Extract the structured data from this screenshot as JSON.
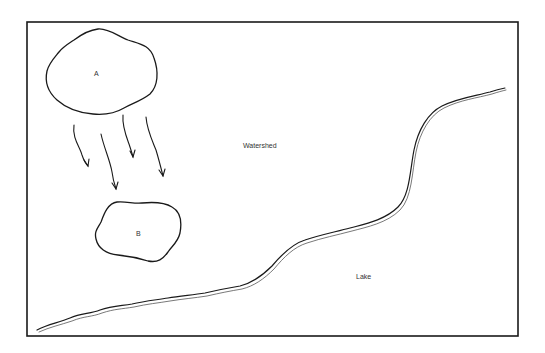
{
  "diagram": {
    "type": "watershed-schematic",
    "frame": {
      "x": 27,
      "y": 22,
      "width": 491,
      "height": 314
    },
    "stroke_color": "#1a1a1a",
    "labels": {
      "area_a": "A",
      "area_b": "B",
      "watershed": "Watershed",
      "lake": "Lake"
    },
    "regions": [
      {
        "id": "A",
        "label": "A",
        "shape": "irregular-blob",
        "center": [
          97,
          72
        ]
      },
      {
        "id": "B",
        "label": "B",
        "shape": "irregular-blob",
        "center": [
          139,
          233
        ]
      }
    ],
    "flow_arrows": {
      "count": 4,
      "direction": "from A toward B (downslope)"
    },
    "shoreline": {
      "description": "wavy double-line boundary separating Watershed (upper-left) from Lake (lower-right)",
      "start": [
        37,
        331
      ],
      "end": [
        505,
        89
      ]
    }
  }
}
